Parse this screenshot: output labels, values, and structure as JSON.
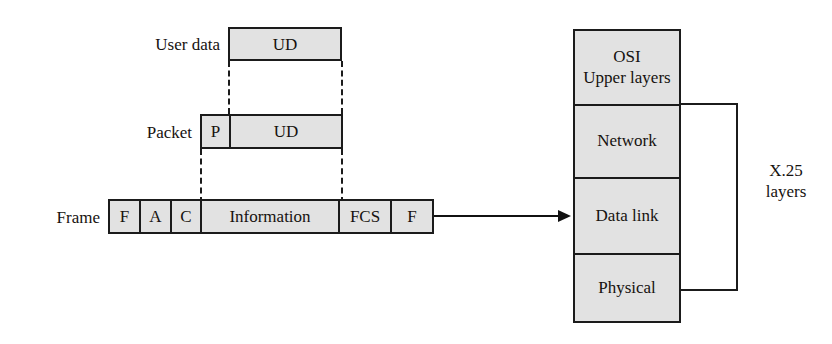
{
  "diagram": {
    "colors": {
      "box_fill": "#e2e2e2",
      "stroke": "#1b1b1b",
      "background": "#ffffff",
      "text": "#16120f"
    },
    "rows": [
      {
        "label": "User data",
        "cells": [
          {
            "text": "UD"
          }
        ]
      },
      {
        "label": "Packet",
        "cells": [
          {
            "text": "P"
          },
          {
            "text": "UD"
          }
        ]
      },
      {
        "label": "Frame",
        "cells": [
          {
            "text": "F"
          },
          {
            "text": "A"
          },
          {
            "text": "C"
          },
          {
            "text": "Information"
          },
          {
            "text": "FCS"
          },
          {
            "text": "F"
          }
        ]
      }
    ],
    "stack": {
      "layers": [
        {
          "line1": "OSI",
          "line2": "Upper layers"
        },
        {
          "line1": "Network",
          "line2": ""
        },
        {
          "line1": "Data link",
          "line2": ""
        },
        {
          "line1": "Physical",
          "line2": ""
        }
      ]
    },
    "bracket": {
      "label_line1": "X.25",
      "label_line2": "layers"
    }
  }
}
